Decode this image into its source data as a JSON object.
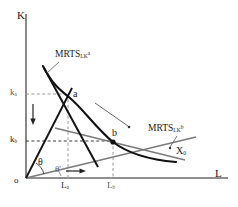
{
  "figure": {
    "type": "economics-isoquant-diagram",
    "title_visible": false,
    "background": "#ffffff",
    "width": 238,
    "height": 207
  },
  "axes": {
    "y_label": "K",
    "x_label": "L",
    "origin_label": "o",
    "axis_color": "#6b6b6b"
  },
  "ticks": {
    "y": [
      {
        "label": "k",
        "sub": "a",
        "value_px_y": 94
      },
      {
        "label": "k",
        "sub": "b",
        "value_px_y": 140
      }
    ],
    "x": [
      {
        "label": "L",
        "sub": "a",
        "value_px_x": 66
      },
      {
        "label": "L",
        "sub": "b",
        "value_px_x": 112
      }
    ],
    "gridline_color": "#999999",
    "gridline_style": "dashed"
  },
  "points": [
    {
      "name": "a",
      "label": "a",
      "x_px": 68,
      "y_px": 97,
      "marker": "none"
    },
    {
      "name": "b",
      "label": "b",
      "x_px": 113,
      "y_px": 143,
      "marker": "dot"
    }
  ],
  "curves": {
    "isoquant": {
      "label": "X",
      "sub": "0",
      "color": "#111111",
      "description": "convex isoquant passing through points a and b"
    },
    "tangent_a": {
      "label": "MRTS",
      "sub": "LK",
      "sup": "a",
      "color": "#111111",
      "description": "steep tangent line at point a"
    },
    "tangent_b": {
      "label": "MRTS",
      "sub": "LK",
      "sup": "b",
      "color": "#777777",
      "description": "flat tangent line at point b"
    }
  },
  "rays": [
    {
      "name": "ray-to-a",
      "angle_label": "θ",
      "color": "#111111"
    },
    {
      "name": "ray-to-b",
      "angle_label": "θ'",
      "color": "#777777"
    }
  ],
  "arrows": [
    {
      "name": "capital-decrease-arrow",
      "direction": "down",
      "x_px": 33,
      "y_px": 112
    },
    {
      "name": "labor-increase-arrow",
      "direction": "right",
      "x_px": 78,
      "y_px": 172
    }
  ]
}
